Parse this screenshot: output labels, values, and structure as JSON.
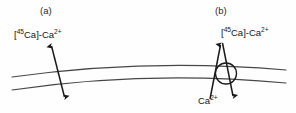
{
  "figure": {
    "width": 296,
    "height": 113,
    "background_color": "#fefefe",
    "ink_color": "#1a1a1a",
    "membrane_color": "#4a4a4a"
  },
  "panels": {
    "a": {
      "tag": "(a)",
      "species_label": {
        "bracket_open": "[",
        "mass_number": "45",
        "element": "Ca",
        "bracket_close": "]-Ca",
        "charge": "2+"
      },
      "arrow_type": "double-headed",
      "description": "passive diffusion across membrane"
    },
    "b": {
      "tag": "(b)",
      "species_label": {
        "bracket_open": "[",
        "mass_number": "45",
        "element": "Ca",
        "bracket_close": "]-Ca",
        "charge": "2+"
      },
      "channel_label": {
        "element": "Ca",
        "charge": "2+"
      },
      "arrow_types": [
        "single-headed-up",
        "single-headed-down"
      ],
      "has_channel_pore": true
    }
  }
}
